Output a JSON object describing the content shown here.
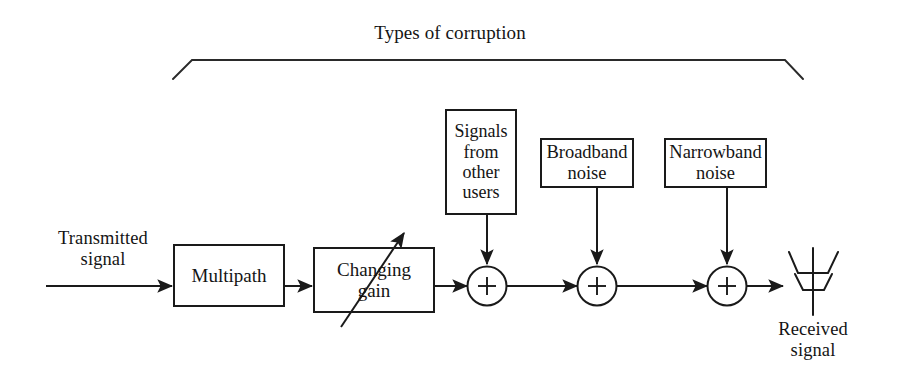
{
  "figure": {
    "title": "Types of corruption",
    "background_color": "#ffffff",
    "line_color": "#1a1a1a"
  },
  "signal_chain": {
    "input_label": "Transmitted\nsignal",
    "output_label": "Received\nsignal",
    "blocks": [
      {
        "id": "multipath",
        "label": "Multipath"
      },
      {
        "id": "changing-gain",
        "label": "Changing\ngain"
      }
    ],
    "summers": [
      {
        "id": "summer-1",
        "symbol": "+"
      },
      {
        "id": "summer-2",
        "symbol": "+"
      },
      {
        "id": "summer-3",
        "symbol": "+"
      }
    ]
  },
  "corruption_sources": [
    {
      "id": "signals-other-users",
      "label": "Signals\nfrom\nother\nusers"
    },
    {
      "id": "broadband-noise",
      "label": "Broadband\nnoise"
    },
    {
      "id": "narrowband-noise",
      "label": "Narrowband\nnoise"
    }
  ]
}
